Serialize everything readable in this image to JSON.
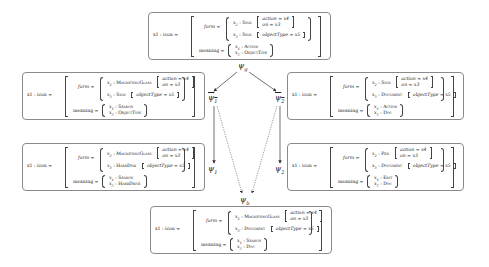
{
  "structures": [
    {
      "id": "psi_g",
      "head": "x1 : icon =",
      "form_label": "form =",
      "meaning_label": "meaning =",
      "form_items": [
        {
          "var": "x2",
          "type": "Sign",
          "feats": [
            "action = x4",
            "on = x3"
          ]
        },
        {
          "var": "x3",
          "type": "Sign",
          "feats": [
            "objectType = x5"
          ]
        }
      ],
      "meaning_items": [
        "x4 : Action",
        "x5 : ObjectType"
      ]
    },
    {
      "id": "psi_1_bar",
      "head": "x1 : icon =",
      "form_label": "form =",
      "meaning_label": "meaning =",
      "form_items": [
        {
          "var": "x2",
          "type": "MagnifyingGlass",
          "feats": [
            "action = x4",
            "on = x3"
          ]
        },
        {
          "var": "x3",
          "type": "Sign",
          "feats": [
            "objectType = x5"
          ]
        }
      ],
      "meaning_items": [
        "x4 : Search",
        "x5 : ObjectType"
      ]
    },
    {
      "id": "psi_2_bar",
      "head": "x1 : icon =",
      "form_label": "form =",
      "meaning_label": "meaning =",
      "form_items": [
        {
          "var": "x2",
          "type": "Sign",
          "feats": [
            "action = x4",
            "on = x3"
          ]
        },
        {
          "var": "x3",
          "type": "Document",
          "feats": [
            "objectType = x5"
          ]
        }
      ],
      "meaning_items": [
        "x4 : Action",
        "x5 : Doc"
      ]
    },
    {
      "id": "psi_1",
      "head": "x1 : icon =",
      "form_label": "form =",
      "meaning_label": "meaning =",
      "form_items": [
        {
          "var": "x2",
          "type": "MagnifyingGlass",
          "feats": [
            "action = x4",
            "on = x3"
          ]
        },
        {
          "var": "x3",
          "type": "HardDisk",
          "feats": [
            "objectType = x5"
          ]
        }
      ],
      "meaning_items": [
        "x4 : Search",
        "x5 : HardDrive"
      ]
    },
    {
      "id": "psi_2",
      "head": "x1 : icon =",
      "form_label": "form =",
      "meaning_label": "meaning =",
      "form_items": [
        {
          "var": "x2",
          "type": "Pen",
          "feats": [
            "action = x4",
            "on = x3"
          ]
        },
        {
          "var": "x3",
          "type": "Document",
          "feats": [
            "objectType = x5"
          ]
        }
      ],
      "meaning_items": [
        "x4 : Edit",
        "x5 : Doc"
      ]
    },
    {
      "id": "psi_b",
      "head": "x1 : icon =",
      "form_label": "form =",
      "meaning_label": "meaning =",
      "form_items": [
        {
          "var": "x2",
          "type": "MagnifyingGlass",
          "feats": [
            "action = x4",
            "on = x3"
          ]
        },
        {
          "var": "x3",
          "type": "Document",
          "feats": [
            "objectType = x5"
          ]
        }
      ],
      "meaning_items": [
        "x4 : Search",
        "x5 : Doc"
      ]
    }
  ],
  "nodes": {
    "psi_g": "ψg",
    "psi_1_bar": "ψ1",
    "psi_2_bar": "ψ2",
    "psi_1": "ψ1",
    "psi_2": "ψ2",
    "psi_b": "ψb"
  },
  "edges": [
    {
      "from": "psi_g",
      "to": "psi_1_bar",
      "style": "solid"
    },
    {
      "from": "psi_g",
      "to": "psi_2_bar",
      "style": "solid"
    },
    {
      "from": "psi_1_bar",
      "to": "psi_1",
      "style": "solid"
    },
    {
      "from": "psi_2_bar",
      "to": "psi_2",
      "style": "solid"
    },
    {
      "from": "psi_1_bar",
      "to": "psi_b",
      "style": "dotted"
    },
    {
      "from": "psi_2_bar",
      "to": "psi_b",
      "style": "dotted"
    }
  ]
}
